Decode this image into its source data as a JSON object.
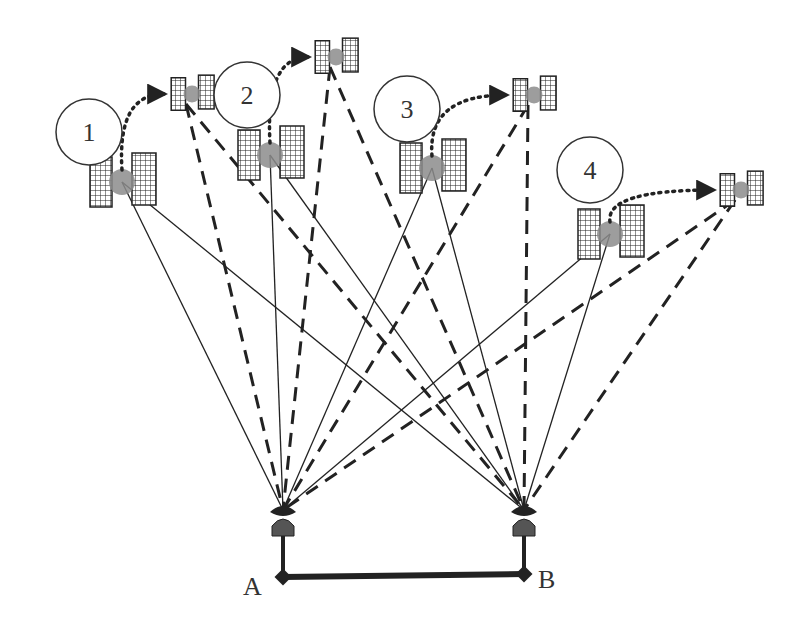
{
  "diagram": {
    "type": "satellite-handover",
    "satellites": [
      {
        "id": "1",
        "label": "1",
        "main": {
          "x": 122,
          "y": 182
        },
        "moved": {
          "x": 186,
          "y": 94
        },
        "circle": {
          "x": 89,
          "y": 132,
          "r": 33
        }
      },
      {
        "id": "2",
        "label": "2",
        "main": {
          "x": 270,
          "y": 155
        },
        "moved": {
          "x": 330,
          "y": 57
        },
        "circle": {
          "x": 247,
          "y": 95,
          "r": 33
        }
      },
      {
        "id": "3",
        "label": "3",
        "main": {
          "x": 432,
          "y": 168
        },
        "moved": {
          "x": 528,
          "y": 95
        },
        "circle": {
          "x": 407,
          "y": 109,
          "r": 33
        }
      },
      {
        "id": "4",
        "label": "4",
        "main": {
          "x": 610,
          "y": 234
        },
        "moved": {
          "x": 735,
          "y": 190
        },
        "circle": {
          "x": 590,
          "y": 170,
          "r": 33
        }
      }
    ],
    "stations": [
      {
        "id": "A",
        "label": "A",
        "x": 283,
        "y": 510,
        "node": {
          "x": 283,
          "y": 577
        }
      },
      {
        "id": "B",
        "label": "B",
        "x": 524,
        "y": 510,
        "node": {
          "x": 524,
          "y": 574
        }
      }
    ],
    "legend": {
      "solid": "current link",
      "dashed": "link after handover",
      "dotted": "satellite motion"
    },
    "colors": {
      "line": "#222222",
      "sat_body": "#8c8c8c",
      "antenna": "#555555"
    }
  }
}
